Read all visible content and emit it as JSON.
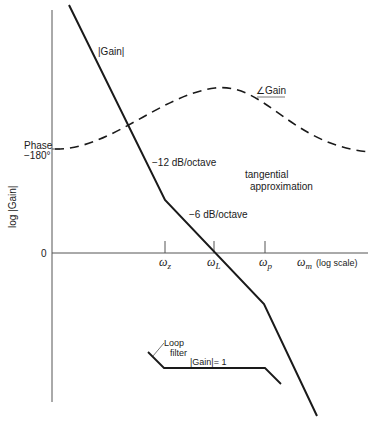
{
  "diagram": {
    "y_axis_label": "log |Gain|",
    "y_zero_label": "0",
    "phase_label_line1": "Phase",
    "phase_label_line2": "−180°",
    "x_axis_label_symbol": "ω",
    "x_axis_label_sub": "m",
    "x_axis_note": "(log scale)",
    "ticks": [
      {
        "symbol": "ω",
        "sub": "z"
      },
      {
        "symbol": "ω",
        "sub": "L"
      },
      {
        "symbol": "ω",
        "sub": "p"
      }
    ],
    "curve_labels": {
      "gain_magnitude": "|Gain|",
      "gain_phase": "∠Gain",
      "slope_12": "−12 dB/octave",
      "slope_6": "−6 dB/octave",
      "tangential_1": "tangential",
      "tangential_2": "approximation",
      "loop_filter_1": "Loop",
      "loop_filter_2": "filter",
      "loop_gain_unity": "|Gain|= 1"
    },
    "colors": {
      "ink": "#1a1a1a",
      "axis": "#555555"
    }
  }
}
